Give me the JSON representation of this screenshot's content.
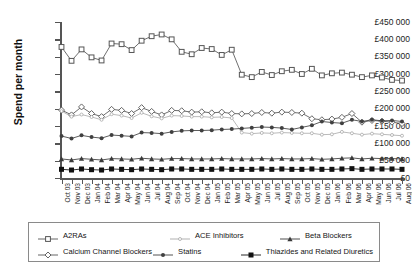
{
  "chart_data": {
    "type": "line",
    "title": "",
    "xlabel": "",
    "ylabel": "Spend per month",
    "ylim": [
      0,
      450000
    ],
    "ytick_labels": [
      "£0",
      "£50 000",
      "£100 000",
      "£150 000",
      "£200 000",
      "£250 000",
      "£300 000",
      "£350 000",
      "£400 000",
      "£450 000"
    ],
    "ytick_values": [
      0,
      50000,
      100000,
      150000,
      200000,
      250000,
      300000,
      350000,
      400000,
      450000
    ],
    "grid": false,
    "legend_position": "bottom",
    "currency": "GBP",
    "categories": [
      "Oct 03",
      "Nov 03",
      "Dec 03",
      "Jan 04",
      "Feb 04",
      "Mar 04",
      "Apr 04",
      "May 04",
      "Jun 04",
      "Jul 04",
      "Aug 04",
      "Sep 04",
      "Oct 04",
      "Nov 04",
      "Dec 04",
      "Jan 05",
      "Feb 05",
      "Mar 05",
      "Apr 05",
      "May 05",
      "Jun 05",
      "Jul 05",
      "Aug 05",
      "Sep 05",
      "Oct 05",
      "Nov 05",
      "Dec 05",
      "Jan 06",
      "Feb 06",
      "Mar 06",
      "Apr 06",
      "May 06",
      "Jun 06",
      "Jul 06",
      "Aug 06"
    ],
    "series": [
      {
        "name": "A2RAs",
        "marker": "open-square",
        "color": "#555555",
        "values": [
          378000,
          338000,
          371000,
          348000,
          339000,
          388000,
          386000,
          369000,
          396000,
          409000,
          414000,
          400000,
          364000,
          357000,
          375000,
          372000,
          355000,
          370000,
          298000,
          291000,
          306000,
          297000,
          308000,
          312000,
          300000,
          315000,
          296000,
          302000,
          304000,
          298000,
          291000,
          296000,
          290000,
          283000,
          281000
        ]
      },
      {
        "name": "Calcium Channel Blockers",
        "marker": "open-diamond",
        "color": "#555555",
        "values": [
          196000,
          182000,
          205000,
          186000,
          177000,
          198000,
          195000,
          186000,
          203000,
          192000,
          182000,
          195000,
          194000,
          190000,
          191000,
          188000,
          190000,
          186000,
          185000,
          186000,
          189000,
          187000,
          190000,
          189000,
          187000,
          171000,
          168000,
          170000,
          175000,
          186000,
          161000,
          166000,
          164000,
          161000,
          157000
        ]
      },
      {
        "name": "ACE Inhibitors",
        "marker": "small-open-circle",
        "color": "#a8a8a8",
        "values": [
          193000,
          177000,
          183000,
          176000,
          168000,
          184000,
          180000,
          173000,
          188000,
          178000,
          172000,
          180000,
          179000,
          177000,
          177000,
          175000,
          176000,
          173000,
          131000,
          128000,
          130000,
          129000,
          131000,
          130000,
          129000,
          129000,
          125000,
          126000,
          133000,
          129000,
          125000,
          128000,
          126000,
          124000,
          122000
        ]
      },
      {
        "name": "Statins",
        "marker": "filled-circle",
        "color": "#404040",
        "values": [
          121000,
          114000,
          123000,
          118000,
          115000,
          124000,
          122000,
          120000,
          131000,
          130000,
          128000,
          133000,
          136000,
          137000,
          137000,
          138000,
          140000,
          141000,
          143000,
          145000,
          147000,
          146000,
          144000,
          140000,
          146000,
          152000,
          163000,
          160000,
          158000,
          168000,
          163000,
          168000,
          165000,
          166000,
          163000
        ]
      },
      {
        "name": "Beta Blockers",
        "marker": "filled-triangle",
        "color": "#3a3a3a",
        "values": [
          55000,
          52000,
          56000,
          54000,
          52000,
          56000,
          55000,
          54000,
          57000,
          55000,
          54000,
          56000,
          56000,
          55000,
          55000,
          55000,
          56000,
          55000,
          55000,
          55000,
          56000,
          55000,
          56000,
          55000,
          55000,
          56000,
          54000,
          55000,
          57000,
          58000,
          55000,
          57000,
          56000,
          56000,
          55000
        ]
      },
      {
        "name": "Thiazides and Related Diuretics",
        "marker": "filled-square",
        "color": "#111111",
        "values": [
          25000,
          23000,
          26000,
          24000,
          23000,
          26000,
          25000,
          24000,
          26000,
          25000,
          24000,
          26000,
          26000,
          25000,
          25000,
          25000,
          26000,
          25000,
          25000,
          25000,
          26000,
          25000,
          26000,
          25000,
          25000,
          26000,
          25000,
          25000,
          26000,
          27000,
          25000,
          26000,
          26000,
          26000,
          25000
        ]
      }
    ]
  },
  "legend": {
    "items": [
      {
        "label": "A2RAs",
        "marker": "open-square"
      },
      {
        "label": "ACE Inhibitors",
        "marker": "small-open-circle"
      },
      {
        "label": "Beta Blockers",
        "marker": "filled-triangle"
      },
      {
        "label": "Calcium Channel Blockers",
        "marker": "open-diamond"
      },
      {
        "label": "Statins",
        "marker": "filled-circle"
      },
      {
        "label": "Thiazides and Related Diuretics",
        "marker": "filled-square"
      }
    ]
  }
}
